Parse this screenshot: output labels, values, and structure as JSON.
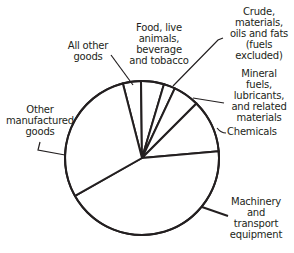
{
  "chart_data": {
    "type": "pie",
    "title": "",
    "start_angle_deg": 104.4,
    "direction": "clockwise",
    "categories": [
      "All other goods",
      "Food, live animals, beverage and tobacco",
      "Crude, materials, oils and fats (fuels excluded)",
      "Mineral fuels, lubricants, and related materials",
      "Chemicals",
      "Machinery and transport equipment",
      "Other manufactured goods"
    ],
    "values": [
      3.8,
      4.8,
      2.4,
      5.5,
      11.1,
      43.2,
      29.2
    ],
    "unit": "%",
    "legend": "none (labels with leader lines)",
    "colors": {
      "fill": "#ffffff",
      "stroke": "#231f20"
    }
  },
  "labels": {
    "all_other": "All other\ngoods",
    "food": "Food, live\nanimals,\nbeverage\nand tobacco",
    "crude": "Crude,\nmaterials,\noils and fats\n(fuels\nexcluded)",
    "mineral": "Mineral\nfuels,\nlubricants,\nand related\nmaterials",
    "chemicals": "Chemicals",
    "machinery": "Machinery\nand\ntransport\nequipment",
    "other_manufactured": "Other\nmanufactured\ngoods"
  }
}
